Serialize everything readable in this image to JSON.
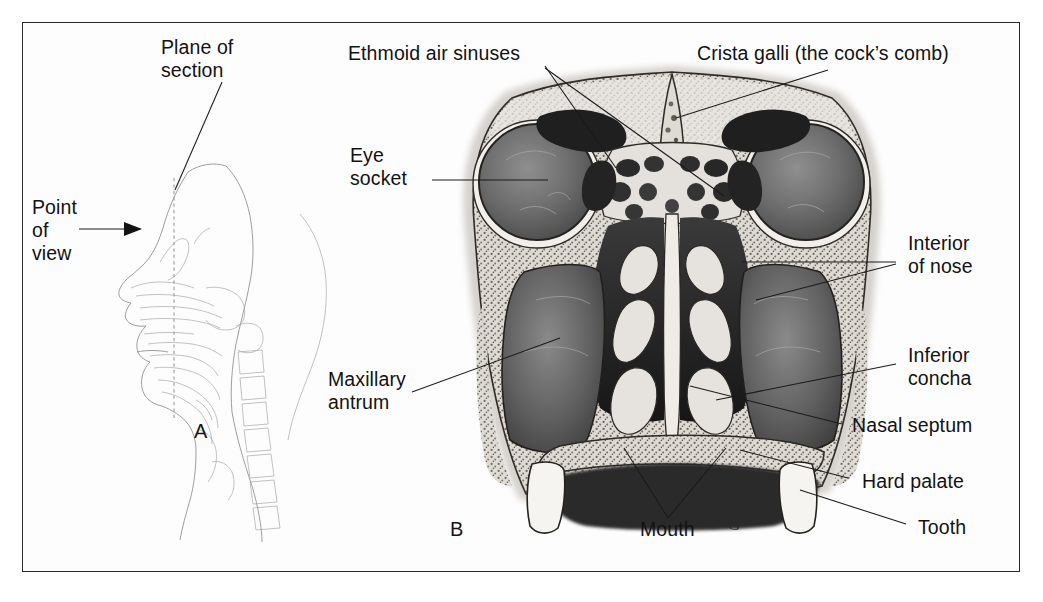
{
  "figure": {
    "background_color": "#ffffff",
    "border_color": "#2a2a2a",
    "ink_color": "#121212"
  },
  "panels": [
    {
      "id": "A",
      "letter": "A",
      "caption": "Sagittal outline of head showing plane of section and viewing direction"
    },
    {
      "id": "B",
      "letter": "B",
      "caption": "Coronal section of the facial skeleton and nasal cavity"
    }
  ],
  "panel_a": {
    "letter": "A",
    "labels": [
      {
        "name": "plane-of-section",
        "text": "Plane of\nsection"
      },
      {
        "name": "point-of-view",
        "text": "Point\nof\nview"
      }
    ]
  },
  "panel_b": {
    "letter": "B",
    "signature": "G",
    "labels_top": [
      {
        "name": "ethmoid-air-sinuses",
        "text": "Ethmoid air sinuses"
      },
      {
        "name": "crista-galli",
        "text": "Crista galli (the cock’s comb)"
      }
    ],
    "labels_left": [
      {
        "name": "eye-socket",
        "text": "Eye\nsocket"
      },
      {
        "name": "maxillary-antrum",
        "text": "Maxillary\nantrum"
      }
    ],
    "labels_right": [
      {
        "name": "interior-of-nose",
        "text": "Interior\nof nose"
      },
      {
        "name": "inferior-concha",
        "text": "Inferior\nconcha"
      },
      {
        "name": "nasal-septum",
        "text": "Nasal septum"
      },
      {
        "name": "hard-palate",
        "text": "Hard palate"
      },
      {
        "name": "tooth",
        "text": "Tooth"
      }
    ],
    "labels_bottom": [
      {
        "name": "mouth",
        "text": "Mouth"
      }
    ]
  }
}
